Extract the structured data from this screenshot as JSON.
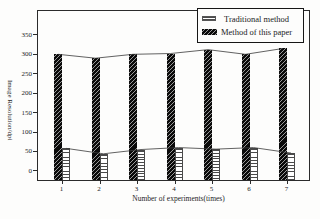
{
  "figure": {
    "ylabel": "Image Resolution/dpi",
    "xlabel": "Number of experiments(times)",
    "legend": [
      {
        "label": "Traditional method",
        "swatch": "horizontal-line-hatch"
      },
      {
        "label": "Method of this paper",
        "swatch": "black-diagonal-hatch"
      }
    ]
  },
  "chart_data": {
    "type": "bar",
    "title": "",
    "xlabel": "Number of experiments(times)",
    "ylabel": "Image Resolution/dpi",
    "categories": [
      "1",
      "2",
      "3",
      "4",
      "5",
      "6",
      "7"
    ],
    "series": [
      {
        "name": "Traditional method",
        "style": "white-horizontal-hatch",
        "values": [
          58,
          44,
          55,
          60,
          56,
          60,
          46
        ]
      },
      {
        "name": "Method of this paper",
        "style": "black-diagonal-hatch",
        "values": [
          300,
          290,
          300,
          302,
          312,
          300,
          315
        ]
      }
    ],
    "yticks": [
      0,
      50,
      100,
      150,
      200,
      250,
      300,
      350
    ],
    "ylim": [
      -26,
      414
    ],
    "grid": false,
    "legend_position": "top-right",
    "bar_top_connector_lines": true
  },
  "colors": {
    "ink": "#1c1c1c",
    "background": "#fdfdfc",
    "bar_dark": "#0a0a0a",
    "hatch_line": "#4a4a4a",
    "axis": "#2b2b2b"
  }
}
